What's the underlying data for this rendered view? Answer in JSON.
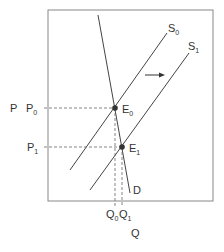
{
  "diagram": {
    "type": "supply-demand shift",
    "axes": {
      "x_label": "Q",
      "y_label": "P"
    },
    "curves": [
      {
        "name": "D",
        "label": "D"
      },
      {
        "name": "S0",
        "label": "S",
        "sub": "0"
      },
      {
        "name": "S1",
        "label": "S",
        "sub": "1"
      }
    ],
    "points": [
      {
        "name": "E0",
        "label": "E",
        "sub": "0"
      },
      {
        "name": "E1",
        "label": "E",
        "sub": "1"
      }
    ],
    "price_labels": [
      {
        "label": "P",
        "sub": "0"
      },
      {
        "label": "P",
        "sub": "1"
      }
    ],
    "quantity_labels": [
      {
        "label": "Q",
        "sub": "0"
      },
      {
        "label": "Q",
        "sub": "1"
      }
    ],
    "shift_arrow": "right",
    "colors": {
      "line": "#444444",
      "point": "#333333",
      "text": "#333333"
    }
  }
}
